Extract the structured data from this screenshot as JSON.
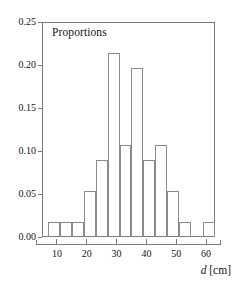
{
  "chart_data": {
    "type": "bar",
    "title": "Proportions",
    "xlabel_variable": "d",
    "xlabel_unit": "[cm]",
    "ylabel": "",
    "xlim": [
      5,
      63
    ],
    "ylim": [
      0.0,
      0.25
    ],
    "grid": false,
    "legend": null,
    "bin_width": 4,
    "bin_edges": [
      7,
      11,
      15,
      19,
      23,
      27,
      31,
      35,
      39,
      43,
      47,
      51,
      55,
      59,
      63
    ],
    "categories": [
      "7-11",
      "11-15",
      "15-19",
      "19-23",
      "23-27",
      "27-31",
      "31-35",
      "35-39",
      "39-43",
      "43-47",
      "47-51",
      "51-55",
      "55-59",
      "59-63"
    ],
    "values": [
      0.018,
      0.018,
      0.018,
      0.053,
      0.089,
      0.214,
      0.107,
      0.196,
      0.089,
      0.107,
      0.053,
      0.017,
      0.0,
      0.017
    ],
    "yticks": [
      0.0,
      0.05,
      0.1,
      0.15,
      0.2,
      0.25
    ],
    "ytick_labels": [
      "0.00",
      "0.05",
      "0.10",
      "0.15",
      "0.20",
      "0.25"
    ],
    "xticks": [
      10,
      20,
      30,
      40,
      50,
      60
    ],
    "xtick_labels": [
      "10",
      "20",
      "30",
      "40",
      "50",
      "60"
    ],
    "colors": {
      "bar_edge": "#8a8a8a",
      "bar_fill": "transparent",
      "axis": "#7a7a7a",
      "text": "#141414"
    }
  }
}
